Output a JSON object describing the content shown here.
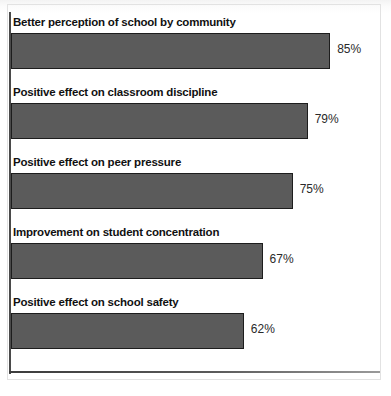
{
  "chart_data": {
    "type": "bar",
    "orientation": "horizontal",
    "title": "",
    "subtitle": "",
    "xlabel": "",
    "ylabel": "",
    "xlim": [
      0,
      100
    ],
    "grid": false,
    "legend": null,
    "value_suffix": "%",
    "categories": [
      "Better perception of school by community",
      "Positive effect on classroom discipline",
      "Positive effect on peer pressure",
      "Improvement on student concentration",
      "Positive effect on school safety"
    ],
    "values": [
      85,
      79,
      75,
      67,
      62
    ],
    "value_labels": [
      "85%",
      "79%",
      "75%",
      "67%",
      "62%"
    ],
    "bars": [
      {
        "label": "Better perception of school by community",
        "value": 85,
        "value_label": "85%"
      },
      {
        "label": "Positive effect on classroom discipline",
        "value": 79,
        "value_label": "79%"
      },
      {
        "label": "Positive effect on peer pressure",
        "value": 75,
        "value_label": "75%"
      },
      {
        "label": "Improvement on student concentration",
        "value": 67,
        "value_label": "67%"
      },
      {
        "label": "Positive effect on school safety",
        "value": 62,
        "value_label": "62%"
      }
    ],
    "colors": {
      "bar_fill": "#5b5b5b",
      "bar_border": "#1d1d1d",
      "label_text": "#111111",
      "value_text": "#2a2a2a",
      "axis_line": "#4a4a4a",
      "background": "#ffffff"
    }
  }
}
